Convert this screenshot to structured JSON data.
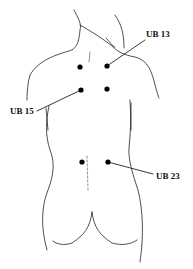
{
  "diagram": {
    "points": [
      {
        "id": "UB 13",
        "label": "UB 13",
        "x": 107,
        "y": 66
      },
      {
        "id": "UB 15",
        "label": "UB 15",
        "x": 81,
        "y": 90
      },
      {
        "id": "UB 23",
        "label": "UB 23",
        "x": 108,
        "y": 162
      }
    ],
    "unlabeled_points": [
      {
        "x": 80,
        "y": 67
      },
      {
        "x": 107,
        "y": 89
      },
      {
        "x": 82,
        "y": 162
      }
    ],
    "colors": {
      "line": "#111111",
      "point": "#000000",
      "background": "#ffffff"
    }
  }
}
